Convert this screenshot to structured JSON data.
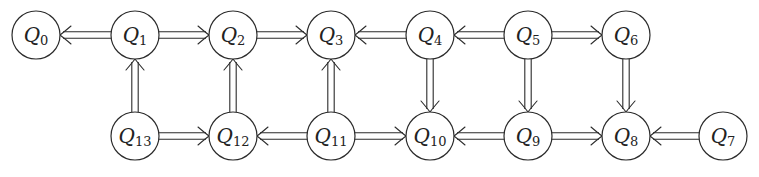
{
  "diagram": {
    "title": "",
    "node_radius": 24,
    "nodes": [
      {
        "id": "Q0",
        "letter": "Q",
        "sub": "0",
        "x": 36,
        "y": 35
      },
      {
        "id": "Q1",
        "letter": "Q",
        "sub": "1",
        "x": 135,
        "y": 35
      },
      {
        "id": "Q2",
        "letter": "Q",
        "sub": "2",
        "x": 233,
        "y": 35
      },
      {
        "id": "Q3",
        "letter": "Q",
        "sub": "3",
        "x": 331,
        "y": 35
      },
      {
        "id": "Q4",
        "letter": "Q",
        "sub": "4",
        "x": 430,
        "y": 35
      },
      {
        "id": "Q5",
        "letter": "Q",
        "sub": "5",
        "x": 528,
        "y": 35
      },
      {
        "id": "Q6",
        "letter": "Q",
        "sub": "6",
        "x": 626,
        "y": 35
      },
      {
        "id": "Q13",
        "letter": "Q",
        "sub": "13",
        "x": 135,
        "y": 136
      },
      {
        "id": "Q12",
        "letter": "Q",
        "sub": "12",
        "x": 233,
        "y": 136
      },
      {
        "id": "Q11",
        "letter": "Q",
        "sub": "11",
        "x": 331,
        "y": 136
      },
      {
        "id": "Q10",
        "letter": "Q",
        "sub": "10",
        "x": 430,
        "y": 136
      },
      {
        "id": "Q9",
        "letter": "Q",
        "sub": "9",
        "x": 528,
        "y": 136
      },
      {
        "id": "Q8",
        "letter": "Q",
        "sub": "8",
        "x": 626,
        "y": 136
      },
      {
        "id": "Q7",
        "letter": "Q",
        "sub": "7",
        "x": 723,
        "y": 136
      }
    ],
    "edges": [
      {
        "from": "Q1",
        "to": "Q0"
      },
      {
        "from": "Q1",
        "to": "Q2"
      },
      {
        "from": "Q2",
        "to": "Q3"
      },
      {
        "from": "Q4",
        "to": "Q3"
      },
      {
        "from": "Q5",
        "to": "Q4"
      },
      {
        "from": "Q5",
        "to": "Q6"
      },
      {
        "from": "Q13",
        "to": "Q1"
      },
      {
        "from": "Q12",
        "to": "Q2"
      },
      {
        "from": "Q11",
        "to": "Q3"
      },
      {
        "from": "Q4",
        "to": "Q10"
      },
      {
        "from": "Q5",
        "to": "Q9"
      },
      {
        "from": "Q6",
        "to": "Q8"
      },
      {
        "from": "Q13",
        "to": "Q12"
      },
      {
        "from": "Q11",
        "to": "Q12"
      },
      {
        "from": "Q11",
        "to": "Q10"
      },
      {
        "from": "Q9",
        "to": "Q10"
      },
      {
        "from": "Q9",
        "to": "Q8"
      },
      {
        "from": "Q7",
        "to": "Q8"
      }
    ],
    "edge_style": "double-line arrow (implies)"
  }
}
